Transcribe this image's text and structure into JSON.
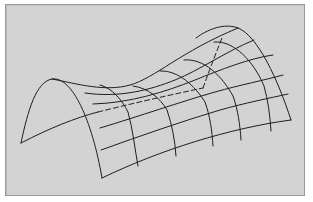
{
  "figure": {
    "background_color": "#d3d3d3",
    "line_color": "#1e1e1e",
    "edges": {
      "left_arch": "M21,143 C28,110 36,82 52,79 C72,76 92,120 102,178",
      "right_arch": "M196,38 C212,26 228,24 238,28 C258,36 278,80 291,120",
      "front_bottom": "M102,178 C160,150 230,128 291,120",
      "back_bottom_solid": "M21,143 C50,128 75,118 98,112",
      "top_ridge": "M52,79 C78,84 105,92 130,85 C155,78 180,52 238,28"
    },
    "hidden_edges": [
      "M98,112 C130,104 165,96 203,88",
      "M203,88 C208,74 214,58 222,38"
    ],
    "long_lines": [
      "M85,93 C120,98 150,90 175,80 C200,70 225,52 254,40",
      "M93,104 C130,103 165,92 195,80 C220,70 250,58 273,55",
      "M100,128 C140,116 180,102 215,92 C240,85 265,80 283,75",
      "M101,150 C140,136 180,122 220,110 C245,103 270,98 288,94"
    ],
    "cross_arches": [
      "M100,85 C112,88 122,100 128,112 C133,130 135,150 138,166",
      "M133,86 C148,88 160,98 167,110 C172,125 175,140 176,156",
      "M160,71 C178,70 195,86 205,102 C210,116 212,130 213,146",
      "M184,60 C204,58 222,76 233,96 C238,110 240,125 241,140",
      "M214,42 C234,40 254,62 264,86 C268,100 270,115 271,131"
    ]
  }
}
